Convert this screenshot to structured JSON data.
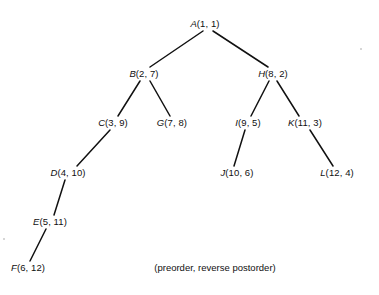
{
  "figure": {
    "background_color": "#ffffff",
    "line_color": "#111111",
    "text_color": "#101010",
    "width": 379,
    "height": 295,
    "caption": "(preorder, reverse postorder)",
    "caption_x": 215,
    "caption_y": 268
  },
  "nodes": [
    {
      "id": "A",
      "label": "A",
      "pair": "(1, 1)",
      "text": "A(1, 1)",
      "preorder": 1,
      "reverse_postorder": 1,
      "x": 205,
      "y": 24,
      "depth": 0
    },
    {
      "id": "B",
      "label": "B",
      "pair": "(2, 7)",
      "text": "B(2, 7)",
      "preorder": 2,
      "reverse_postorder": 7,
      "x": 144,
      "y": 74,
      "depth": 1
    },
    {
      "id": "H",
      "label": "H",
      "pair": "(8, 2)",
      "text": "H(8, 2)",
      "preorder": 8,
      "reverse_postorder": 2,
      "x": 273,
      "y": 74,
      "depth": 1
    },
    {
      "id": "C",
      "label": "C",
      "pair": "(3, 9)",
      "text": "C(3, 9)",
      "preorder": 3,
      "reverse_postorder": 9,
      "x": 113,
      "y": 123,
      "depth": 2
    },
    {
      "id": "G",
      "label": "G",
      "pair": "(7, 8)",
      "text": "G(7, 8)",
      "preorder": 7,
      "reverse_postorder": 8,
      "x": 172,
      "y": 123,
      "depth": 2
    },
    {
      "id": "I",
      "label": "I",
      "pair": "(9, 5)",
      "text": "I(9, 5)",
      "preorder": 9,
      "reverse_postorder": 5,
      "x": 248,
      "y": 123,
      "depth": 2
    },
    {
      "id": "K",
      "label": "K",
      "pair": "(11, 3)",
      "text": "K(11, 3)",
      "preorder": 11,
      "reverse_postorder": 3,
      "x": 305,
      "y": 123,
      "depth": 2
    },
    {
      "id": "D",
      "label": "D",
      "pair": "(4, 10)",
      "text": "D(4, 10)",
      "preorder": 4,
      "reverse_postorder": 10,
      "x": 68,
      "y": 173,
      "depth": 3
    },
    {
      "id": "J",
      "label": "J",
      "pair": "(10, 6)",
      "text": "J(10, 6)",
      "preorder": 10,
      "reverse_postorder": 6,
      "x": 237,
      "y": 173,
      "depth": 3
    },
    {
      "id": "L",
      "label": "L",
      "pair": "(12, 4)",
      "text": "L(12, 4)",
      "preorder": 12,
      "reverse_postorder": 4,
      "x": 337,
      "y": 173,
      "depth": 3
    },
    {
      "id": "E",
      "label": "E",
      "pair": "(5, 11)",
      "text": "E(5, 11)",
      "preorder": 5,
      "reverse_postorder": 11,
      "x": 50,
      "y": 222,
      "depth": 4
    },
    {
      "id": "F",
      "label": "F",
      "pair": "(6, 12)",
      "text": "F(6, 12)",
      "preorder": 6,
      "reverse_postorder": 12,
      "x": 28,
      "y": 268,
      "depth": 5
    }
  ],
  "edges": [
    {
      "from": "A",
      "to": "B",
      "x1": 203,
      "y1": 31,
      "x2": 150,
      "y2": 67
    },
    {
      "from": "A",
      "to": "H",
      "x1": 213,
      "y1": 31,
      "x2": 268,
      "y2": 67
    },
    {
      "from": "B",
      "to": "C",
      "x1": 140,
      "y1": 81,
      "x2": 118,
      "y2": 116
    },
    {
      "from": "B",
      "to": "G",
      "x1": 150,
      "y1": 81,
      "x2": 170,
      "y2": 116
    },
    {
      "from": "H",
      "to": "I",
      "x1": 269,
      "y1": 81,
      "x2": 251,
      "y2": 116
    },
    {
      "from": "H",
      "to": "K",
      "x1": 277,
      "y1": 81,
      "x2": 299,
      "y2": 116
    },
    {
      "from": "C",
      "to": "D",
      "x1": 110,
      "y1": 130,
      "x2": 77,
      "y2": 166
    },
    {
      "from": "I",
      "to": "J",
      "x1": 245,
      "y1": 130,
      "x2": 234,
      "y2": 166
    },
    {
      "from": "K",
      "to": "L",
      "x1": 310,
      "y1": 130,
      "x2": 333,
      "y2": 166
    },
    {
      "from": "D",
      "to": "E",
      "x1": 65,
      "y1": 180,
      "x2": 54,
      "y2": 215
    },
    {
      "from": "E",
      "to": "F",
      "x1": 46,
      "y1": 229,
      "x2": 30,
      "y2": 261
    }
  ],
  "specks": [
    {
      "x": 3,
      "y": 238
    },
    {
      "x": 360,
      "y": 48
    }
  ]
}
